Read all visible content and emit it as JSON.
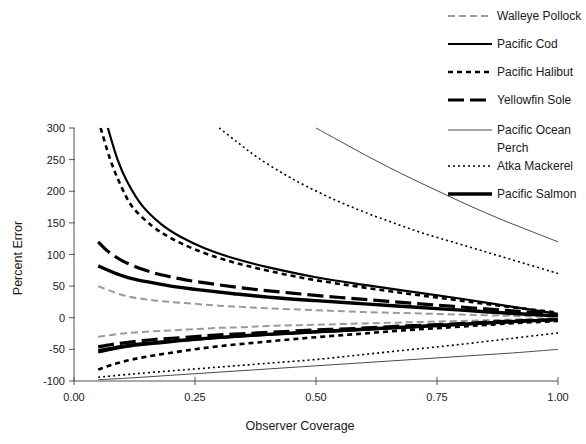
{
  "chart_data": {
    "type": "line",
    "title": "",
    "xlabel": "Observer Coverage",
    "ylabel": "Percent Error",
    "xlim": [
      0.0,
      1.0
    ],
    "ylim": [
      -100,
      300
    ],
    "xticks": [
      "0.00",
      "0.25",
      "0.50",
      "0.75",
      "1.00"
    ],
    "xtick_values": [
      0.0,
      0.25,
      0.5,
      0.75,
      1.0
    ],
    "yticks": [
      "300",
      "250",
      "200",
      "150",
      "100",
      "50",
      "0",
      "-50",
      "-100"
    ],
    "ytick_values": [
      300,
      250,
      200,
      150,
      100,
      50,
      0,
      -50,
      -100
    ],
    "grid": false,
    "legend_position": "right",
    "series": [
      {
        "name": "Walleye Pollock",
        "style": "dashed-gray",
        "color": "#9a9a9a",
        "linewidth": 2.0,
        "dash": "7,4",
        "upper": [
          [
            0.05,
            50
          ],
          [
            0.1,
            36
          ],
          [
            0.15,
            29
          ],
          [
            0.2,
            25
          ],
          [
            0.25,
            22
          ],
          [
            0.3,
            19
          ],
          [
            0.35,
            17
          ],
          [
            0.4,
            15
          ],
          [
            0.5,
            12
          ],
          [
            0.6,
            9
          ],
          [
            0.7,
            7
          ],
          [
            0.8,
            5
          ],
          [
            0.9,
            3
          ],
          [
            1.0,
            1
          ]
        ],
        "lower": [
          [
            0.05,
            -30
          ],
          [
            0.1,
            -25
          ],
          [
            0.15,
            -22
          ],
          [
            0.2,
            -20
          ],
          [
            0.25,
            -18
          ],
          [
            0.3,
            -16
          ],
          [
            0.35,
            -15
          ],
          [
            0.4,
            -13
          ],
          [
            0.5,
            -11
          ],
          [
            0.6,
            -9
          ],
          [
            0.7,
            -7
          ],
          [
            0.8,
            -5
          ],
          [
            0.9,
            -3
          ],
          [
            1.0,
            -1
          ]
        ]
      },
      {
        "name": "Pacific Cod",
        "style": "solid",
        "color": "#000000",
        "linewidth": 2.2,
        "dash": "none",
        "upper": [
          [
            0.07,
            300
          ],
          [
            0.09,
            250
          ],
          [
            0.11,
            215
          ],
          [
            0.14,
            178
          ],
          [
            0.18,
            148
          ],
          [
            0.22,
            128
          ],
          [
            0.27,
            110
          ],
          [
            0.33,
            94
          ],
          [
            0.4,
            80
          ],
          [
            0.5,
            64
          ],
          [
            0.6,
            52
          ],
          [
            0.7,
            41
          ],
          [
            0.8,
            30
          ],
          [
            0.9,
            18
          ],
          [
            1.0,
            6
          ]
        ],
        "lower": [
          [
            0.05,
            -55
          ],
          [
            0.08,
            -50
          ],
          [
            0.12,
            -45
          ],
          [
            0.17,
            -41
          ],
          [
            0.22,
            -37
          ],
          [
            0.28,
            -33
          ],
          [
            0.35,
            -29
          ],
          [
            0.45,
            -25
          ],
          [
            0.55,
            -21
          ],
          [
            0.65,
            -17
          ],
          [
            0.75,
            -13
          ],
          [
            0.85,
            -9
          ],
          [
            0.92,
            -6
          ],
          [
            1.0,
            -3
          ]
        ]
      },
      {
        "name": "Pacific Halibut",
        "style": "dotted-thick",
        "color": "#000000",
        "linewidth": 2.6,
        "dash": "5,4",
        "upper": [
          [
            0.055,
            300
          ],
          [
            0.075,
            250
          ],
          [
            0.095,
            212
          ],
          [
            0.12,
            176
          ],
          [
            0.16,
            146
          ],
          [
            0.2,
            126
          ],
          [
            0.25,
            108
          ],
          [
            0.31,
            92
          ],
          [
            0.38,
            78
          ],
          [
            0.48,
            62
          ],
          [
            0.58,
            50
          ],
          [
            0.68,
            39
          ],
          [
            0.78,
            29
          ],
          [
            0.88,
            19
          ],
          [
            1.0,
            8
          ]
        ],
        "lower": [
          [
            0.05,
            -82
          ],
          [
            0.08,
            -74
          ],
          [
            0.12,
            -66
          ],
          [
            0.17,
            -59
          ],
          [
            0.23,
            -52
          ],
          [
            0.3,
            -45
          ],
          [
            0.38,
            -39
          ],
          [
            0.48,
            -32
          ],
          [
            0.58,
            -26
          ],
          [
            0.68,
            -20
          ],
          [
            0.78,
            -15
          ],
          [
            0.88,
            -10
          ],
          [
            1.0,
            -5
          ]
        ]
      },
      {
        "name": "Yellowfin Sole",
        "style": "long-dash",
        "color": "#000000",
        "linewidth": 3.2,
        "dash": "16,6",
        "upper": [
          [
            0.05,
            120
          ],
          [
            0.07,
            105
          ],
          [
            0.1,
            90
          ],
          [
            0.14,
            77
          ],
          [
            0.18,
            68
          ],
          [
            0.23,
            60
          ],
          [
            0.29,
            53
          ],
          [
            0.36,
            46
          ],
          [
            0.45,
            39
          ],
          [
            0.55,
            32
          ],
          [
            0.65,
            26
          ],
          [
            0.75,
            20
          ],
          [
            0.85,
            14
          ],
          [
            0.92,
            10
          ],
          [
            1.0,
            5
          ]
        ],
        "lower": [
          [
            0.05,
            -46
          ],
          [
            0.08,
            -42
          ],
          [
            0.12,
            -38
          ],
          [
            0.17,
            -34
          ],
          [
            0.23,
            -31
          ],
          [
            0.3,
            -27
          ],
          [
            0.38,
            -24
          ],
          [
            0.48,
            -20
          ],
          [
            0.58,
            -17
          ],
          [
            0.68,
            -13
          ],
          [
            0.78,
            -10
          ],
          [
            0.88,
            -6
          ],
          [
            1.0,
            -3
          ]
        ]
      },
      {
        "name": "Pacific Ocean Perch",
        "style": "thin-solid",
        "color": "#4a4a4a",
        "linewidth": 1.0,
        "dash": "none",
        "upper": [
          [
            0.5,
            300
          ],
          [
            0.55,
            279
          ],
          [
            0.6,
            258
          ],
          [
            0.65,
            238
          ],
          [
            0.7,
            219
          ],
          [
            0.75,
            201
          ],
          [
            0.8,
            183
          ],
          [
            0.85,
            166
          ],
          [
            0.9,
            150
          ],
          [
            0.95,
            135
          ],
          [
            1.0,
            120
          ]
        ],
        "lower": [
          [
            0.05,
            -98
          ],
          [
            0.12,
            -95
          ],
          [
            0.2,
            -91
          ],
          [
            0.3,
            -86
          ],
          [
            0.4,
            -81
          ],
          [
            0.5,
            -76
          ],
          [
            0.6,
            -71
          ],
          [
            0.7,
            -66
          ],
          [
            0.8,
            -61
          ],
          [
            0.9,
            -56
          ],
          [
            1.0,
            -50
          ]
        ]
      },
      {
        "name": "Atka Mackerel",
        "style": "fine-dotted",
        "color": "#000000",
        "linewidth": 1.6,
        "dash": "2,3",
        "upper": [
          [
            0.3,
            300
          ],
          [
            0.34,
            276
          ],
          [
            0.38,
            253
          ],
          [
            0.43,
            229
          ],
          [
            0.48,
            208
          ],
          [
            0.54,
            186
          ],
          [
            0.6,
            167
          ],
          [
            0.66,
            150
          ],
          [
            0.72,
            134
          ],
          [
            0.79,
            118
          ],
          [
            0.86,
            102
          ],
          [
            0.93,
            86
          ],
          [
            1.0,
            70
          ]
        ],
        "lower": [
          [
            0.05,
            -94
          ],
          [
            0.12,
            -89
          ],
          [
            0.2,
            -84
          ],
          [
            0.3,
            -78
          ],
          [
            0.4,
            -72
          ],
          [
            0.5,
            -66
          ],
          [
            0.6,
            -58
          ],
          [
            0.7,
            -50
          ],
          [
            0.8,
            -42
          ],
          [
            0.9,
            -33
          ],
          [
            1.0,
            -24
          ]
        ]
      },
      {
        "name": "Pacific Salmon",
        "style": "solid-thick",
        "color": "#000000",
        "linewidth": 3.4,
        "dash": "none",
        "upper": [
          [
            0.05,
            82
          ],
          [
            0.08,
            72
          ],
          [
            0.11,
            64
          ],
          [
            0.15,
            57
          ],
          [
            0.2,
            50
          ],
          [
            0.26,
            44
          ],
          [
            0.33,
            38
          ],
          [
            0.41,
            32
          ],
          [
            0.5,
            27
          ],
          [
            0.6,
            22
          ],
          [
            0.7,
            17
          ],
          [
            0.8,
            12
          ],
          [
            0.9,
            7
          ],
          [
            1.0,
            3
          ]
        ],
        "lower": [
          [
            0.05,
            -52
          ],
          [
            0.08,
            -48
          ],
          [
            0.12,
            -43
          ],
          [
            0.17,
            -39
          ],
          [
            0.23,
            -35
          ],
          [
            0.3,
            -31
          ],
          [
            0.38,
            -27
          ],
          [
            0.48,
            -23
          ],
          [
            0.58,
            -19
          ],
          [
            0.68,
            -15
          ],
          [
            0.78,
            -11
          ],
          [
            0.88,
            -7
          ],
          [
            1.0,
            -3
          ]
        ]
      }
    ]
  },
  "legend": {
    "items": [
      {
        "label": "Walleye Pollock"
      },
      {
        "label": "Pacific Cod"
      },
      {
        "label": "Pacific Halibut"
      },
      {
        "label": "Yellowfin Sole"
      },
      {
        "label": "Pacific Ocean"
      },
      {
        "label": "Perch"
      },
      {
        "label": "Atka Mackerel"
      },
      {
        "label": "Pacific Salmon"
      }
    ]
  },
  "axes": {
    "x_title": "Observer Coverage",
    "y_title": "Percent Error",
    "x_tick_labels": [
      "0.00",
      "0.25",
      "0.50",
      "0.75",
      "1.00"
    ],
    "y_tick_labels": [
      "300",
      "250",
      "200",
      "150",
      "100",
      "50",
      "0",
      "-50",
      "-100"
    ]
  }
}
